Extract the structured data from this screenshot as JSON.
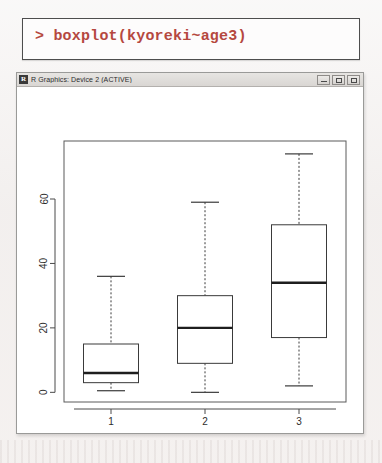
{
  "console": {
    "prompt": ">",
    "command": "boxplot(kyoreki~age3)",
    "full_line": "> boxplot(kyoreki~age3)",
    "text_color": "#b5483f"
  },
  "window": {
    "icon_label": "R",
    "title": "R Graphics: Device 2 (ACTIVE)",
    "buttons": {
      "minimize": "Minimize",
      "maximize": "Maximize",
      "close": "Close"
    }
  },
  "chart_data": {
    "type": "box",
    "title": "",
    "xlabel": "",
    "ylabel": "",
    "categories": [
      "1",
      "2",
      "3"
    ],
    "yticks": [
      0,
      20,
      40,
      60
    ],
    "ylim": [
      -3,
      78
    ],
    "grid": false,
    "legend": false,
    "boxes": [
      {
        "category": "1",
        "whisker_low": 0.5,
        "q1": 3,
        "median": 6,
        "q3": 15,
        "whisker_high": 36
      },
      {
        "category": "2",
        "whisker_low": 0,
        "q1": 9,
        "median": 20,
        "q3": 30,
        "whisker_high": 59
      },
      {
        "category": "3",
        "whisker_low": 2,
        "q1": 17,
        "median": 34,
        "q3": 52,
        "whisker_high": 74
      }
    ]
  }
}
